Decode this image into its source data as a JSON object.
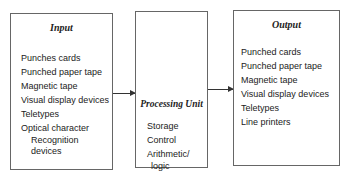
{
  "input": {
    "title": "Input",
    "items": [
      "Punches cards",
      "Punched paper tape",
      "Magnetic tape",
      "Visual display devices",
      "Teletypes",
      "Optical character"
    ],
    "continuation": [
      "Recognition",
      "devices"
    ]
  },
  "processing": {
    "title": "Processing Unit",
    "items": [
      "Storage",
      "Control",
      "Arithmetic/"
    ],
    "continuation": "logic"
  },
  "output": {
    "title": "Output",
    "items": [
      "Punched cards",
      "Punched paper tape",
      "Magnetic tape",
      "Visual display devices",
      "Teletypes",
      "Line printers"
    ]
  }
}
